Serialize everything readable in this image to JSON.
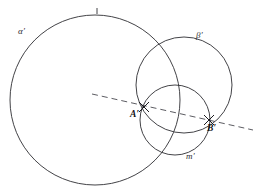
{
  "figure": {
    "type": "euclidean-geometry-diagram",
    "width": 261,
    "height": 189,
    "background_color": "#ffffff",
    "stroke_color": "#2e2e32",
    "dash_color": "#4a4a50"
  },
  "labels": {
    "alpha": "α′",
    "beta": "β′",
    "m": "m′",
    "point_a": "A′",
    "point_b": "B′"
  },
  "circles": [
    {
      "name": "alpha-prime",
      "label": "α′",
      "cx": 95,
      "cy": 100,
      "r": 85,
      "stroke": "#2e2e32"
    },
    {
      "name": "beta-prime",
      "label": "β′",
      "cx": 184,
      "cy": 85,
      "r": 48,
      "stroke": "#2e2e32"
    },
    {
      "name": "m-prime",
      "label": "m′",
      "cx": 175,
      "cy": 120,
      "r": 35,
      "stroke": "#2e2e32"
    }
  ],
  "line": {
    "name": "radical-axis",
    "style": "dashed",
    "x1": 92,
    "y1": 94,
    "x2": 253,
    "y2": 130,
    "stroke": "#4a4a50"
  },
  "points": [
    {
      "name": "point-a-prime",
      "label": "A′",
      "x": 144,
      "y": 107,
      "marker": "cross"
    },
    {
      "name": "point-b-prime",
      "label": "B′",
      "x": 209,
      "y": 120,
      "marker": "cross"
    }
  ],
  "tick_marks": [
    {
      "name": "alpha-top-tick",
      "x": 97,
      "y": 11
    }
  ]
}
